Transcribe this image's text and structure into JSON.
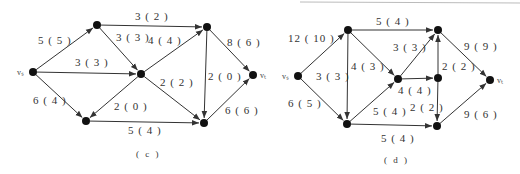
{
  "figures": [
    {
      "id": "c",
      "caption": "( c )",
      "nodes": [
        {
          "id": "vs",
          "label": "vₛ",
          "x": 33,
          "y": 72
        },
        {
          "id": "a",
          "label": "",
          "x": 97,
          "y": 25
        },
        {
          "id": "b",
          "label": "",
          "x": 141,
          "y": 74
        },
        {
          "id": "c",
          "label": "",
          "x": 86,
          "y": 121
        },
        {
          "id": "d",
          "label": "",
          "x": 207,
          "y": 27
        },
        {
          "id": "e",
          "label": "",
          "x": 204,
          "y": 123
        },
        {
          "id": "vt",
          "label": "vₜ",
          "x": 253,
          "y": 75
        }
      ],
      "edges": [
        {
          "from": "vs",
          "to": "a",
          "label": "5 ( 5 )",
          "lx": 38,
          "ly": 44
        },
        {
          "from": "vs",
          "to": "b",
          "label": "3 ( 3 )",
          "lx": 75,
          "ly": 66
        },
        {
          "from": "vs",
          "to": "c",
          "label": "6 ( 4 )",
          "lx": 33,
          "ly": 104
        },
        {
          "from": "a",
          "to": "d",
          "label": "3 ( 2 )",
          "lx": 135,
          "ly": 20
        },
        {
          "from": "a",
          "to": "b",
          "label": "3 ( 3 )",
          "lx": 116,
          "ly": 41
        },
        {
          "from": "b",
          "to": "d",
          "label": "4 ( 4 )",
          "lx": 148,
          "ly": 44
        },
        {
          "from": "b",
          "to": "c",
          "label": "2 ( 0 )",
          "lx": 114,
          "ly": 110
        },
        {
          "from": "b",
          "to": "e",
          "label": "2 ( 2 )",
          "lx": 160,
          "ly": 86
        },
        {
          "from": "c",
          "to": "e",
          "label": "5 ( 4 )",
          "lx": 128,
          "ly": 134
        },
        {
          "from": "d",
          "to": "e",
          "label": "2 ( 0 )",
          "lx": 208,
          "ly": 80
        },
        {
          "from": "d",
          "to": "vt",
          "label": "8 ( 6 )",
          "lx": 227,
          "ly": 46
        },
        {
          "from": "e",
          "to": "vt",
          "label": "6 ( 6 )",
          "lx": 225,
          "ly": 114
        }
      ],
      "caption_x": 136,
      "caption_y": 157
    },
    {
      "id": "d",
      "caption": "( d )",
      "nodes": [
        {
          "id": "vs",
          "label": "vₛ",
          "x": 298,
          "y": 76
        },
        {
          "id": "a",
          "label": "",
          "x": 348,
          "y": 30
        },
        {
          "id": "b",
          "label": "",
          "x": 347,
          "y": 124
        },
        {
          "id": "c",
          "label": "",
          "x": 398,
          "y": 79
        },
        {
          "id": "d",
          "label": "",
          "x": 438,
          "y": 30
        },
        {
          "id": "e",
          "label": "",
          "x": 438,
          "y": 78
        },
        {
          "id": "f",
          "label": "",
          "x": 437,
          "y": 126
        },
        {
          "id": "vt",
          "label": "vₜ",
          "x": 490,
          "y": 80
        }
      ],
      "edges": [
        {
          "from": "vs",
          "to": "a",
          "label": "12 ( 10 )",
          "lx": 288,
          "ly": 42
        },
        {
          "from": "vs",
          "to": "b",
          "label": "6 ( 5 )",
          "lx": 288,
          "ly": 107
        },
        {
          "from": "a",
          "to": "d",
          "label": "5 ( 4 )",
          "lx": 376,
          "ly": 25
        },
        {
          "from": "a",
          "to": "b",
          "label": "4 ( 3 )",
          "lx": 351,
          "ly": 70
        },
        {
          "from": "a",
          "to": "c",
          "label": "",
          "lx": 0,
          "ly": 0
        },
        {
          "from": "vs_label",
          "to": "",
          "label": "3 ( 3 )",
          "lx": 316,
          "ly": 80
        },
        {
          "from": "c",
          "to": "d",
          "label": "3 ( 3 )",
          "lx": 393,
          "ly": 51
        },
        {
          "from": "c",
          "to": "e",
          "label": "4 ( 4 )",
          "lx": 398,
          "ly": 94
        },
        {
          "from": "b",
          "to": "c",
          "label": "5 ( 4 )",
          "lx": 373,
          "ly": 115
        },
        {
          "from": "e",
          "to": "d",
          "label": "2 ( 2 )",
          "lx": 442,
          "ly": 70
        },
        {
          "from": "e",
          "to": "f",
          "label": "2 ( 2 )",
          "lx": 410,
          "ly": 111
        },
        {
          "from": "b",
          "to": "f",
          "label": "5 ( 4 )",
          "lx": 381,
          "ly": 142
        },
        {
          "from": "d",
          "to": "vt",
          "label": "9 ( 9 )",
          "lx": 464,
          "ly": 50
        },
        {
          "from": "f",
          "to": "vt",
          "label": "9 ( 6 )",
          "lx": 464,
          "ly": 118
        }
      ],
      "caption_x": 384,
      "caption_y": 163
    }
  ]
}
